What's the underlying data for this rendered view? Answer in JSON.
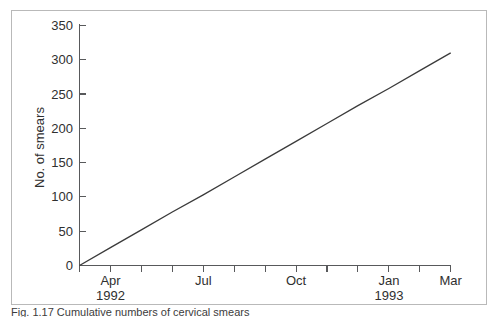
{
  "figure": {
    "background_color": "#ffffff",
    "frame_color": "#b9b9b9",
    "axis_color": "#58595b",
    "line_color": "#3b3b3b"
  },
  "caption": {
    "text": "Fig. 1.17 Cumulative numbers of cervical smears"
  },
  "chart_data": {
    "type": "line",
    "title": "",
    "xlabel": "",
    "ylabel": "No. of smears",
    "ylim": [
      0,
      350
    ],
    "ytick_values": [
      0,
      50,
      100,
      150,
      200,
      250,
      300,
      350
    ],
    "ytick_labels": [
      "0",
      "50",
      "100",
      "150",
      "200",
      "250",
      "300",
      "350"
    ],
    "grid": false,
    "legend": false,
    "x_tick_count": 13,
    "x_major_labels": [
      {
        "label": "Apr",
        "sublabel": "1992",
        "month_index": 1
      },
      {
        "label": "Jul",
        "sublabel": "",
        "month_index": 4
      },
      {
        "label": "Oct",
        "sublabel": "",
        "month_index": 7
      },
      {
        "label": "Jan",
        "sublabel": "1993",
        "month_index": 10
      },
      {
        "label": "Mar",
        "sublabel": "",
        "month_index": 12
      }
    ],
    "x": [
      0,
      1,
      2,
      3,
      4,
      5,
      6,
      7,
      8,
      9,
      10,
      11,
      12
    ],
    "values": [
      0,
      26,
      52,
      78,
      103,
      129,
      155,
      181,
      207,
      233,
      258,
      284,
      310
    ],
    "series": [
      {
        "name": "Cumulative smears",
        "values": [
          0,
          26,
          52,
          78,
          103,
          129,
          155,
          181,
          207,
          233,
          258,
          284,
          310
        ]
      }
    ]
  }
}
